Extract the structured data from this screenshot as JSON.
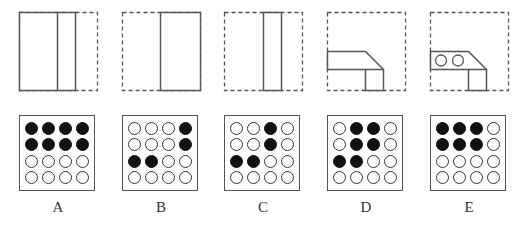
{
  "options": [
    {
      "label": "A",
      "grid": [
        [
          1,
          1,
          1,
          1
        ],
        [
          1,
          1,
          1,
          1
        ],
        [
          0,
          0,
          0,
          0
        ],
        [
          0,
          0,
          0,
          0
        ]
      ],
      "shape": "rect-with-divider"
    },
    {
      "label": "B",
      "grid": [
        [
          0,
          0,
          0,
          1
        ],
        [
          0,
          0,
          0,
          1
        ],
        [
          1,
          1,
          0,
          0
        ],
        [
          0,
          0,
          0,
          0
        ]
      ],
      "shape": "right-rect"
    },
    {
      "label": "C",
      "grid": [
        [
          0,
          0,
          1,
          0
        ],
        [
          0,
          0,
          1,
          0
        ],
        [
          1,
          1,
          0,
          0
        ],
        [
          0,
          0,
          0,
          0
        ]
      ],
      "shape": "narrow-bar"
    },
    {
      "label": "D",
      "grid": [
        [
          0,
          1,
          1,
          0
        ],
        [
          0,
          1,
          1,
          0
        ],
        [
          1,
          1,
          0,
          0
        ],
        [
          0,
          0,
          0,
          0
        ]
      ],
      "shape": "l-shape"
    },
    {
      "label": "E",
      "grid": [
        [
          1,
          1,
          1,
          0
        ],
        [
          1,
          1,
          1,
          0
        ],
        [
          0,
          0,
          0,
          0
        ],
        [
          0,
          0,
          0,
          0
        ]
      ],
      "shape": "l-shape-with-circles"
    }
  ],
  "colors": {
    "line": "#555555",
    "filled_dot": "#111111",
    "background": "#ffffff"
  }
}
